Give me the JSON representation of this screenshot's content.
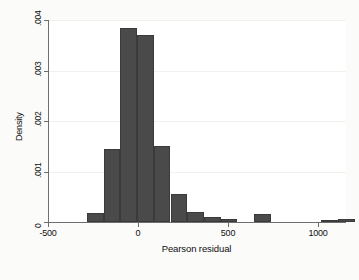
{
  "chart_data": {
    "type": "bar",
    "title": "",
    "subtitle": "",
    "xlabel": "Pearson residual",
    "ylabel": "Density",
    "grid": true,
    "legend": null,
    "xlim": [
      -500,
      1150
    ],
    "ylim": [
      0,
      0.004
    ],
    "xticks": [
      -500,
      0,
      500,
      1000
    ],
    "xtick_labels": [
      "-500",
      "0",
      "500",
      "1000"
    ],
    "yticks": [
      0,
      0.001,
      0.002,
      0.003,
      0.004
    ],
    "ytick_labels": [
      "0",
      ".001",
      ".002",
      ".003",
      ".004"
    ],
    "bin_width": 93,
    "bar_color": "#4a4a4a",
    "bar_edge_color": "#3a3a3a",
    "plot_background": "#ffffff",
    "figure_background": "#fbfbfa",
    "axis_color": "#6e6e6e",
    "bins": [
      {
        "left": -290,
        "right": -197,
        "density": 0.00018
      },
      {
        "left": -197,
        "right": -104,
        "density": 0.00145
      },
      {
        "left": -104,
        "right": -11,
        "density": 0.00385
      },
      {
        "left": -11,
        "right": 82,
        "density": 0.0037
      },
      {
        "left": 82,
        "right": 175,
        "density": 0.0015
      },
      {
        "left": 175,
        "right": 268,
        "density": 0.00055
      },
      {
        "left": 268,
        "right": 361,
        "density": 0.0002
      },
      {
        "left": 361,
        "right": 454,
        "density": 9e-05
      },
      {
        "left": 454,
        "right": 547,
        "density": 5e-05
      },
      {
        "left": 640,
        "right": 733,
        "density": 0.00015
      },
      {
        "left": 1012,
        "right": 1105,
        "density": 3e-05
      },
      {
        "left": 1105,
        "right": 1198,
        "density": 5e-05
      }
    ],
    "categories": [
      "-290",
      "-197",
      "-104",
      "-11",
      "82",
      "175",
      "268",
      "361",
      "454",
      "640",
      "1012",
      "1105"
    ],
    "values": [
      0.00018,
      0.00145,
      0.00385,
      0.0037,
      0.0015,
      0.00055,
      0.0002,
      9e-05,
      5e-05,
      0.00015,
      3e-05,
      5e-05
    ]
  }
}
